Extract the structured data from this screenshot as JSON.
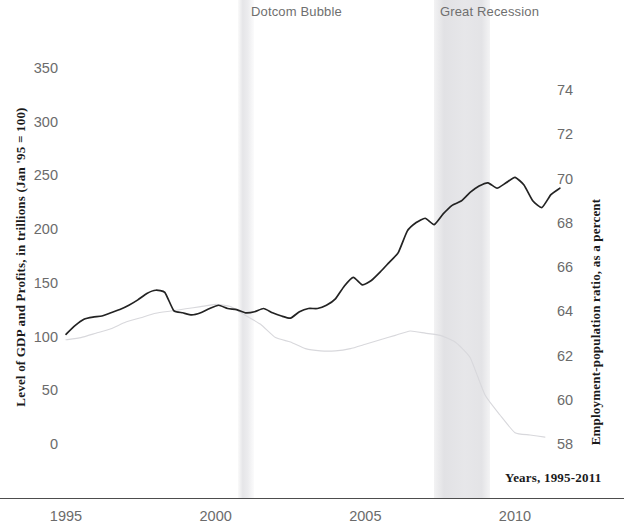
{
  "chart_data": {
    "type": "line",
    "title": "",
    "xlabel": "Years, 1995-2011",
    "ylabel": "Level of GDP and Profits, in trillions (Jan '95 = 100)",
    "y2label": "Employment-population ratio, as a percent",
    "xlim": [
      1995,
      2011.6
    ],
    "ylim": [
      0,
      362
    ],
    "y2lim": [
      57.2,
      75.1
    ],
    "grid": false,
    "legend_position": "none",
    "x_ticks": [
      1995,
      2000,
      2005,
      2010
    ],
    "x_tick_labels": [
      "1995",
      "2000",
      "2005",
      "2010"
    ],
    "y_ticks": [
      0,
      50,
      100,
      150,
      200,
      250,
      300,
      350
    ],
    "y_tick_labels": [
      "0",
      "50",
      "100",
      "150",
      "200",
      "250",
      "300",
      "350"
    ],
    "y2_ticks": [
      58,
      60,
      62,
      64,
      66,
      68,
      70,
      72,
      74
    ],
    "y2_tick_labels": [
      "58",
      "60",
      "62",
      "64",
      "66",
      "68",
      "70",
      "72",
      "74"
    ],
    "annotations": [
      {
        "label": "Dotcom Bubble",
        "type": "shaded-band",
        "x_start": 2000.2,
        "x_end": 2000.8
      },
      {
        "label": "Great Recession",
        "type": "shaded-band",
        "x_start": 2007.6,
        "x_end": 2009.5
      }
    ],
    "series": [
      {
        "name": "Level of GDP and Profits",
        "axis": "left",
        "color": "#232323",
        "x": [
          1995.0,
          1995.3,
          1995.6,
          1995.9,
          1996.2,
          1996.5,
          1996.8,
          1997.1,
          1997.4,
          1997.7,
          1998.0,
          1998.3,
          1998.6,
          1998.9,
          1999.2,
          1999.5,
          1999.8,
          2000.1,
          2000.4,
          2000.7,
          2001.0,
          2001.3,
          2001.6,
          2001.9,
          2002.2,
          2002.5,
          2002.8,
          2003.1,
          2003.4,
          2003.7,
          2004.0,
          2004.3,
          2004.6,
          2004.9,
          2005.2,
          2005.5,
          2005.8,
          2006.1,
          2006.4,
          2006.7,
          2007.0,
          2007.3,
          2007.6,
          2007.9,
          2008.2,
          2008.5,
          2008.8,
          2009.1,
          2009.4,
          2009.7,
          2010.0,
          2010.3,
          2010.6,
          2010.9,
          2011.2,
          2011.5
        ],
        "values": [
          104,
          112,
          118,
          120,
          121,
          124,
          127,
          131,
          136,
          142,
          145,
          143,
          126,
          124,
          122,
          124,
          128,
          131,
          128,
          127,
          124,
          125,
          128,
          124,
          121,
          119,
          125,
          128,
          128,
          131,
          137,
          149,
          157,
          150,
          154,
          162,
          171,
          180,
          200,
          208,
          212,
          206,
          216,
          224,
          228,
          236,
          242,
          245,
          240,
          245,
          250,
          243,
          228,
          222,
          234,
          240
        ]
      },
      {
        "name": "Employment-population ratio",
        "axis": "right",
        "color": "#d8d8dc",
        "x": [
          1995.0,
          1995.5,
          1996.0,
          1996.5,
          1997.0,
          1997.5,
          1998.0,
          1998.5,
          1999.0,
          1999.5,
          2000.0,
          2000.5,
          2001.0,
          2001.5,
          2002.0,
          2002.5,
          2003.0,
          2003.5,
          2004.0,
          2004.5,
          2005.0,
          2005.5,
          2006.0,
          2006.5,
          2007.0,
          2007.5,
          2008.0,
          2008.5,
          2009.0,
          2009.5,
          2010.0,
          2010.5,
          2011.0
        ],
        "values": [
          62.8,
          62.9,
          63.1,
          63.3,
          63.6,
          63.8,
          64.0,
          64.1,
          64.2,
          64.3,
          64.4,
          64.3,
          63.9,
          63.5,
          62.9,
          62.7,
          62.4,
          62.3,
          62.3,
          62.4,
          62.6,
          62.8,
          63.0,
          63.2,
          63.1,
          63.0,
          62.7,
          62.0,
          60.3,
          59.4,
          58.6,
          58.5,
          58.4
        ]
      }
    ]
  },
  "axes": {
    "left_title": "Level of GDP and Profits, in trillions (Jan '95 = 100)",
    "right_title": "Employment-population ratio, as a percent",
    "x_title": "Years, 1995-2011"
  },
  "bands": {
    "dotcom": "Dotcom Bubble",
    "recession": "Great Recession"
  },
  "colors": {
    "primary_line": "#232323",
    "secondary_line": "#d8d8dc",
    "band_fill": "#e4e4e7",
    "tick_text": "#6b6b6b",
    "axis_rule": "#4d4d4d",
    "title_text": "#1a1a1a"
  }
}
